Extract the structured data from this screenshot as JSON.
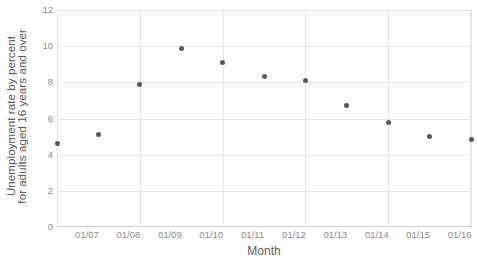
{
  "chart_data": {
    "type": "scatter",
    "title": "",
    "xlabel": "Month",
    "ylabel_line1": "Unemployment rate by percent",
    "ylabel_line2": "for adults aged 16 years and over",
    "x_tick_labels": [
      "01/07",
      "01/08",
      "01/09",
      "01/10",
      "01/11",
      "01/12",
      "01/13",
      "01/14",
      "01/15",
      "01/16",
      "01/17"
    ],
    "y_tick_labels": [
      "0",
      "2",
      "4",
      "6",
      "8",
      "10",
      "12"
    ],
    "y_ticks": [
      0,
      2,
      4,
      6,
      8,
      10,
      12
    ],
    "ylim": [
      0,
      12
    ],
    "grid": "both",
    "legend": "none",
    "marker_color": "#595959",
    "grid_color": "#e4e6e8",
    "categories": [
      "01/07",
      "01/08",
      "01/09",
      "01/10",
      "01/11",
      "01/12",
      "01/13",
      "01/14",
      "01/15",
      "01/16",
      "01/17"
    ],
    "values": [
      4.6,
      5.1,
      7.9,
      9.9,
      9.1,
      8.3,
      8.1,
      6.7,
      5.8,
      5.0,
      4.85
    ],
    "points": [
      {
        "x": "01/07",
        "y": 4.6
      },
      {
        "x": "01/08",
        "y": 5.1
      },
      {
        "x": "01/09",
        "y": 7.9
      },
      {
        "x": "01/10",
        "y": 9.9
      },
      {
        "x": "01/11",
        "y": 9.1
      },
      {
        "x": "01/12",
        "y": 8.3
      },
      {
        "x": "01/13",
        "y": 8.1
      },
      {
        "x": "01/14",
        "y": 6.7
      },
      {
        "x": "01/15",
        "y": 5.8
      },
      {
        "x": "01/16",
        "y": 5.0
      },
      {
        "x": "01/17",
        "y": 4.85
      }
    ]
  }
}
